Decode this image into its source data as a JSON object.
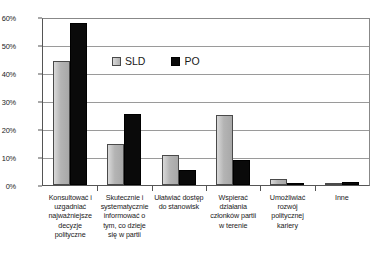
{
  "chart_data": {
    "type": "bar",
    "title": "",
    "xlabel": "",
    "ylabel": "",
    "ylim": [
      0,
      60
    ],
    "ytick_labels": [
      "0%",
      "10%",
      "20%",
      "30%",
      "40%",
      "50%",
      "60%"
    ],
    "ytick_values": [
      0,
      10,
      20,
      30,
      40,
      50,
      60
    ],
    "grid": true,
    "legend_position": "inside-top-left",
    "categories": [
      "Konsultować i uzgadniać najważniejsze decyzje polityczne",
      "Skutecznie i systematycznie informować o tym, co dzieje się w partii",
      "Ułatwiać dostęp do stanowisk",
      "Wspierać działania członków partii w terenie",
      "Umożliwiać rozwój politycznej kariery",
      "Inne"
    ],
    "series": [
      {
        "name": "SLD",
        "color": "#b4b4b4",
        "values": [
          45,
          15,
          10.8,
          25.2,
          2,
          0
        ]
      },
      {
        "name": "PO",
        "color": "#0a0a0a",
        "values": [
          58.5,
          25.8,
          5.6,
          9,
          0.6,
          1
        ]
      }
    ]
  },
  "legend": {
    "entries": [
      {
        "label": "SLD"
      },
      {
        "label": "PO"
      }
    ]
  }
}
